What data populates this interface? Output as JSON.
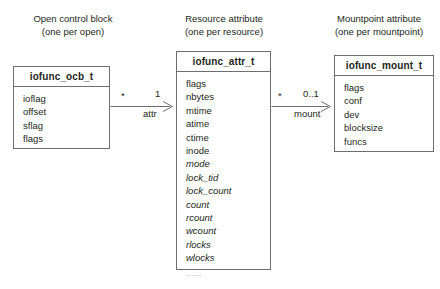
{
  "diagram": {
    "type": "uml-class-diagram",
    "captions": [
      {
        "id": "open-control-block",
        "line1": "Open control block",
        "line2": "(one per open)"
      },
      {
        "id": "resource-attribute",
        "line1": "Resource attribute",
        "line2": "(one per resource)"
      },
      {
        "id": "mountpoint-attribute",
        "line1": "Mountpoint attribute",
        "line2": "(one per mountpoint)"
      }
    ],
    "classes": [
      {
        "id": "iofunc_ocb_t",
        "title": "iofunc_ocb_t",
        "fields": [
          {
            "name": "ioflag",
            "style": "normal"
          },
          {
            "name": "offset",
            "style": "normal"
          },
          {
            "name": "sflag",
            "style": "normal"
          },
          {
            "name": "flags",
            "style": "normal"
          }
        ]
      },
      {
        "id": "iofunc_attr_t",
        "title": "iofunc_attr_t",
        "fields": [
          {
            "name": "flags",
            "style": "normal"
          },
          {
            "name": "nbytes",
            "style": "normal"
          },
          {
            "name": "mtime",
            "style": "normal"
          },
          {
            "name": "atime",
            "style": "normal"
          },
          {
            "name": "ctime",
            "style": "normal"
          },
          {
            "name": "inode",
            "style": "normal"
          },
          {
            "name": "mode",
            "style": "italic"
          },
          {
            "name": "lock_tid",
            "style": "italic"
          },
          {
            "name": "lock_count",
            "style": "italic"
          },
          {
            "name": "count",
            "style": "italic"
          },
          {
            "name": "rcount",
            "style": "italic"
          },
          {
            "name": "wcount",
            "style": "italic"
          },
          {
            "name": "rlocks",
            "style": "italic"
          },
          {
            "name": "wlocks",
            "style": "italic"
          },
          {
            "name": "……",
            "style": "ellipsis"
          }
        ]
      },
      {
        "id": "iofunc_mount_t",
        "title": "iofunc_mount_t",
        "fields": [
          {
            "name": "flags",
            "style": "normal"
          },
          {
            "name": "conf",
            "style": "normal"
          },
          {
            "name": "dev",
            "style": "normal"
          },
          {
            "name": "blocksize",
            "style": "normal"
          },
          {
            "name": "funcs",
            "style": "normal"
          }
        ]
      }
    ],
    "associations": [
      {
        "id": "ocb-to-attr",
        "from": "iofunc_ocb_t",
        "to": "iofunc_attr_t",
        "source_multiplicity": "*",
        "target_multiplicity": "1",
        "role": "attr"
      },
      {
        "id": "attr-to-mount",
        "from": "iofunc_attr_t",
        "to": "iofunc_mount_t",
        "source_multiplicity": "*",
        "target_multiplicity": "0..1",
        "role": "mount"
      }
    ],
    "colors": {
      "background": "#ffffff",
      "line": "#6e6e6e",
      "text": "#231f20",
      "muted": "#8b8b8b"
    }
  }
}
